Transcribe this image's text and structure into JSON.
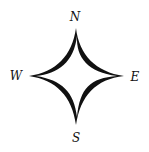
{
  "figure": {
    "type": "compass-rose",
    "background": "#ffffff",
    "fill_color": "#111111"
  },
  "labels": {
    "north": "N",
    "east": "E",
    "south": "S",
    "west": "W"
  }
}
